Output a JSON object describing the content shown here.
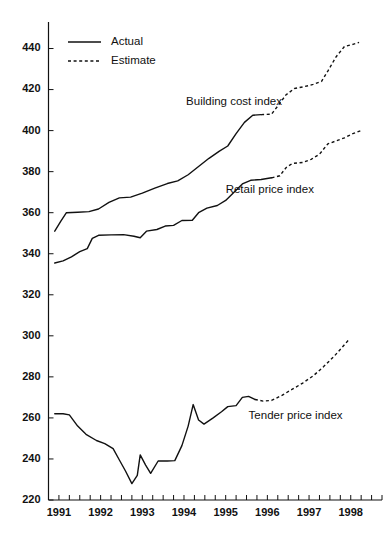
{
  "chart_data": {
    "type": "line",
    "title": "",
    "subtitle": "",
    "xlabel": "",
    "ylabel": "",
    "xlim": [
      1990.75,
      1998.75
    ],
    "ylim": [
      220,
      450
    ],
    "y_ticks": [
      220,
      240,
      260,
      280,
      300,
      320,
      340,
      360,
      380,
      400,
      420,
      440
    ],
    "x_ticks": [
      1991,
      1992,
      1993,
      1994,
      1995,
      1996,
      1997,
      1998
    ],
    "x_tick_labels": [
      "1991",
      "1992",
      "1993",
      "1994",
      "1995",
      "1996",
      "1997",
      "1998"
    ],
    "y_tick_labels": [
      "220",
      "240",
      "260",
      "280",
      "300",
      "320",
      "340",
      "360",
      "380",
      "400",
      "420",
      "440"
    ],
    "x_minor_ticks_per_year": 4,
    "grid": false,
    "legend": {
      "position": "top-left",
      "entries": [
        {
          "label": "Actual",
          "style": "solid"
        },
        {
          "label": "Estimate",
          "style": "dotted"
        }
      ]
    },
    "annotations": [
      {
        "text": "Building cost index",
        "x": 1994.05,
        "y": 414.0
      },
      {
        "text": "Retail price index",
        "x": 1995.0,
        "y": 371.0
      },
      {
        "text": "Tender price index",
        "x": 1995.55,
        "y": 261.0
      }
    ],
    "series": [
      {
        "name": "Building cost index",
        "style": "solid",
        "segment": "actual",
        "points": [
          {
            "x": 1990.9,
            "y": 351.0
          },
          {
            "x": 1991.05,
            "y": 356.0
          },
          {
            "x": 1991.18,
            "y": 360.0
          },
          {
            "x": 1991.45,
            "y": 360.2
          },
          {
            "x": 1991.72,
            "y": 360.5
          },
          {
            "x": 1991.95,
            "y": 361.8
          },
          {
            "x": 1992.2,
            "y": 365.0
          },
          {
            "x": 1992.45,
            "y": 367.2
          },
          {
            "x": 1992.72,
            "y": 367.6
          },
          {
            "x": 1993.0,
            "y": 369.5
          },
          {
            "x": 1993.3,
            "y": 372.0
          },
          {
            "x": 1993.6,
            "y": 374.2
          },
          {
            "x": 1993.85,
            "y": 375.5
          },
          {
            "x": 1994.1,
            "y": 378.5
          },
          {
            "x": 1994.35,
            "y": 382.5
          },
          {
            "x": 1994.6,
            "y": 386.5
          },
          {
            "x": 1994.85,
            "y": 390.0
          },
          {
            "x": 1995.05,
            "y": 392.5
          },
          {
            "x": 1995.25,
            "y": 398.5
          },
          {
            "x": 1995.45,
            "y": 404.0
          },
          {
            "x": 1995.65,
            "y": 407.5
          },
          {
            "x": 1995.85,
            "y": 407.8
          }
        ]
      },
      {
        "name": "Building cost index",
        "style": "dotted",
        "segment": "estimate",
        "points": [
          {
            "x": 1995.85,
            "y": 407.8
          },
          {
            "x": 1996.1,
            "y": 408.0
          },
          {
            "x": 1996.25,
            "y": 412.0
          },
          {
            "x": 1996.45,
            "y": 417.5
          },
          {
            "x": 1996.65,
            "y": 420.5
          },
          {
            "x": 1996.9,
            "y": 421.5
          },
          {
            "x": 1997.1,
            "y": 422.5
          },
          {
            "x": 1997.3,
            "y": 424.0
          },
          {
            "x": 1997.45,
            "y": 429.0
          },
          {
            "x": 1997.65,
            "y": 436.0
          },
          {
            "x": 1997.85,
            "y": 441.0
          },
          {
            "x": 1998.05,
            "y": 442.0
          },
          {
            "x": 1998.2,
            "y": 443.0
          }
        ]
      },
      {
        "name": "Retail price index",
        "style": "solid",
        "segment": "actual",
        "points": [
          {
            "x": 1990.9,
            "y": 335.5
          },
          {
            "x": 1991.1,
            "y": 336.5
          },
          {
            "x": 1991.3,
            "y": 338.5
          },
          {
            "x": 1991.5,
            "y": 341.0
          },
          {
            "x": 1991.68,
            "y": 342.5
          },
          {
            "x": 1991.8,
            "y": 347.5
          },
          {
            "x": 1991.95,
            "y": 349.0
          },
          {
            "x": 1992.25,
            "y": 349.2
          },
          {
            "x": 1992.55,
            "y": 349.3
          },
          {
            "x": 1992.8,
            "y": 348.5
          },
          {
            "x": 1992.95,
            "y": 347.8
          },
          {
            "x": 1993.1,
            "y": 351.0
          },
          {
            "x": 1993.35,
            "y": 351.8
          },
          {
            "x": 1993.55,
            "y": 353.5
          },
          {
            "x": 1993.75,
            "y": 353.8
          },
          {
            "x": 1993.95,
            "y": 356.2
          },
          {
            "x": 1994.2,
            "y": 356.3
          },
          {
            "x": 1994.35,
            "y": 360.0
          },
          {
            "x": 1994.55,
            "y": 362.2
          },
          {
            "x": 1994.8,
            "y": 363.5
          },
          {
            "x": 1995.0,
            "y": 366.0
          },
          {
            "x": 1995.2,
            "y": 370.0
          },
          {
            "x": 1995.4,
            "y": 374.0
          },
          {
            "x": 1995.6,
            "y": 375.8
          },
          {
            "x": 1995.85,
            "y": 376.2
          },
          {
            "x": 1996.1,
            "y": 377.0
          }
        ]
      },
      {
        "name": "Retail price index",
        "style": "dotted",
        "segment": "estimate",
        "points": [
          {
            "x": 1996.1,
            "y": 377.0
          },
          {
            "x": 1996.3,
            "y": 378.0
          },
          {
            "x": 1996.45,
            "y": 382.0
          },
          {
            "x": 1996.6,
            "y": 384.0
          },
          {
            "x": 1996.85,
            "y": 384.5
          },
          {
            "x": 1997.05,
            "y": 386.0
          },
          {
            "x": 1997.25,
            "y": 388.5
          },
          {
            "x": 1997.45,
            "y": 393.5
          },
          {
            "x": 1997.65,
            "y": 395.0
          },
          {
            "x": 1997.85,
            "y": 396.5
          },
          {
            "x": 1998.05,
            "y": 398.5
          },
          {
            "x": 1998.25,
            "y": 400.0
          }
        ]
      },
      {
        "name": "Tender price index",
        "style": "solid",
        "segment": "actual",
        "points": [
          {
            "x": 1990.9,
            "y": 262.0
          },
          {
            "x": 1991.1,
            "y": 262.0
          },
          {
            "x": 1991.25,
            "y": 261.5
          },
          {
            "x": 1991.45,
            "y": 256.0
          },
          {
            "x": 1991.65,
            "y": 252.0
          },
          {
            "x": 1991.9,
            "y": 249.0
          },
          {
            "x": 1992.1,
            "y": 247.5
          },
          {
            "x": 1992.3,
            "y": 245.0
          },
          {
            "x": 1992.45,
            "y": 239.5
          },
          {
            "x": 1992.6,
            "y": 234.0
          },
          {
            "x": 1992.75,
            "y": 228.0
          },
          {
            "x": 1992.88,
            "y": 232.0
          },
          {
            "x": 1992.95,
            "y": 242.0
          },
          {
            "x": 1993.08,
            "y": 237.0
          },
          {
            "x": 1993.2,
            "y": 233.0
          },
          {
            "x": 1993.38,
            "y": 239.0
          },
          {
            "x": 1993.6,
            "y": 239.0
          },
          {
            "x": 1993.78,
            "y": 239.2
          },
          {
            "x": 1993.95,
            "y": 246.5
          },
          {
            "x": 1994.1,
            "y": 256.0
          },
          {
            "x": 1994.22,
            "y": 266.5
          },
          {
            "x": 1994.35,
            "y": 259.0
          },
          {
            "x": 1994.48,
            "y": 257.0
          },
          {
            "x": 1994.7,
            "y": 260.0
          },
          {
            "x": 1994.9,
            "y": 263.0
          },
          {
            "x": 1995.05,
            "y": 265.5
          },
          {
            "x": 1995.25,
            "y": 266.0
          },
          {
            "x": 1995.4,
            "y": 270.0
          },
          {
            "x": 1995.55,
            "y": 270.5
          },
          {
            "x": 1995.7,
            "y": 269.0
          }
        ]
      },
      {
        "name": "Tender price index",
        "style": "dotted",
        "segment": "estimate",
        "points": [
          {
            "x": 1995.7,
            "y": 269.0
          },
          {
            "x": 1995.9,
            "y": 268.2
          },
          {
            "x": 1996.1,
            "y": 268.5
          },
          {
            "x": 1996.35,
            "y": 271.0
          },
          {
            "x": 1996.6,
            "y": 274.0
          },
          {
            "x": 1996.85,
            "y": 277.0
          },
          {
            "x": 1997.1,
            "y": 280.5
          },
          {
            "x": 1997.35,
            "y": 285.0
          },
          {
            "x": 1997.6,
            "y": 290.0
          },
          {
            "x": 1997.8,
            "y": 294.5
          },
          {
            "x": 1997.95,
            "y": 298.0
          }
        ]
      }
    ]
  }
}
